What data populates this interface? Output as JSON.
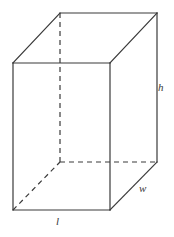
{
  "figure": {
    "shape_name": "rectangular-prism",
    "background_color": "#ffffff",
    "stroke_color": "#3a3a3a",
    "stroke_width": 1.2,
    "canvas": {
      "width": 174,
      "height": 237
    }
  },
  "labels": {
    "height": "h",
    "width": "w",
    "length": "l"
  },
  "geometry": {
    "vertices": {
      "front_top_left": [
        13,
        63
      ],
      "front_top_right": [
        110,
        63
      ],
      "front_bottom_left": [
        13,
        210
      ],
      "front_bottom_right": [
        110,
        210
      ],
      "back_top_left": [
        60,
        13
      ],
      "back_top_right": [
        157,
        13
      ],
      "back_bottom_left": [
        60,
        162
      ],
      "back_bottom_right": [
        157,
        162
      ]
    },
    "solid_edges": [
      {
        "name": "front-top-edge",
        "from": [
          13,
          63
        ],
        "to": [
          110,
          63
        ]
      },
      {
        "name": "front-left-edge",
        "from": [
          13,
          63
        ],
        "to": [
          13,
          210
        ]
      },
      {
        "name": "front-right-edge",
        "from": [
          110,
          63
        ],
        "to": [
          110,
          210
        ]
      },
      {
        "name": "front-bottom-edge",
        "from": [
          13,
          210
        ],
        "to": [
          110,
          210
        ]
      },
      {
        "name": "back-top-edge",
        "from": [
          60,
          13
        ],
        "to": [
          157,
          13
        ]
      },
      {
        "name": "back-right-edge",
        "from": [
          157,
          13
        ],
        "to": [
          157,
          162
        ]
      },
      {
        "name": "top-left-diagonal-edge",
        "from": [
          13,
          63
        ],
        "to": [
          60,
          13
        ]
      },
      {
        "name": "top-right-diagonal-edge",
        "from": [
          110,
          63
        ],
        "to": [
          157,
          13
        ]
      },
      {
        "name": "bottom-right-diagonal-edge",
        "from": [
          110,
          210
        ],
        "to": [
          157,
          162
        ]
      }
    ],
    "dashed_edges": [
      {
        "name": "hidden-back-left-vertical-edge",
        "from": [
          60,
          13
        ],
        "to": [
          60,
          162
        ]
      },
      {
        "name": "hidden-back-bottom-edge",
        "from": [
          60,
          162
        ],
        "to": [
          157,
          162
        ]
      },
      {
        "name": "hidden-bottom-left-diagonal-edge",
        "from": [
          13,
          210
        ],
        "to": [
          60,
          162
        ]
      }
    ],
    "dash_pattern": "5 4"
  },
  "label_positions": {
    "height": [
      163,
      88
    ],
    "width": [
      144,
      189
    ],
    "length": [
      59,
      222
    ]
  }
}
